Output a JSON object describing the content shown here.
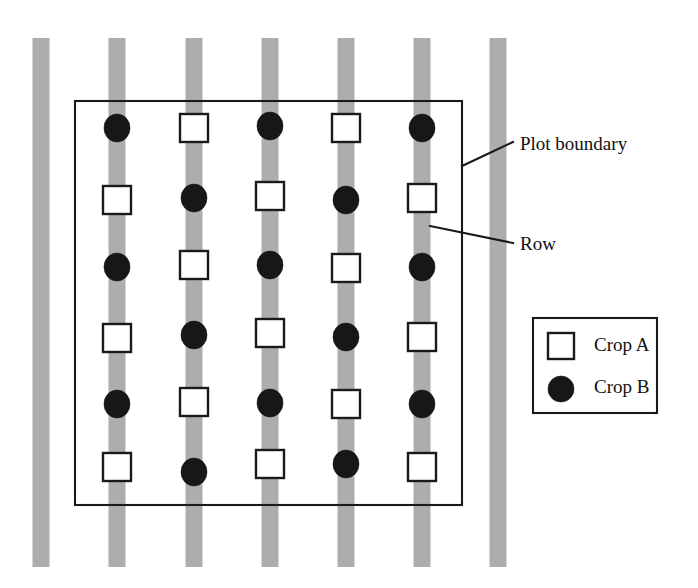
{
  "figure": {
    "width": 698,
    "height": 588,
    "background_color": "#ffffff"
  },
  "colors": {
    "row_stripe": "#adadad",
    "line": "#1a1a1a",
    "crop_a_fill": "#ffffff",
    "crop_b_fill": "#171717",
    "text": "#111111",
    "background": "#ffffff"
  },
  "annotations": [
    {
      "id": "plot-boundary",
      "label": "Plot boundary",
      "text_x": 520,
      "text_y": 146,
      "leader": {
        "x1": 462,
        "y1": 166,
        "x2": 513,
        "y2": 142
      }
    },
    {
      "id": "row",
      "label": "Row",
      "text_x": 520,
      "text_y": 246,
      "leader": {
        "x1": 430,
        "y1": 226,
        "x2": 513,
        "y2": 243
      }
    }
  ],
  "legend": {
    "box": {
      "x": 533,
      "y": 318,
      "width": 124,
      "height": 95
    },
    "entries": [
      {
        "id": "legend-crop-a",
        "label": "Crop A",
        "marker": "open-square",
        "marker_x": 548,
        "marker_y": 333,
        "marker_size": 26,
        "text_x": 594,
        "text_y": 347
      },
      {
        "id": "legend-crop-b",
        "label": "Crop B",
        "marker": "filled-circle",
        "marker_cx": 561,
        "marker_cy": 389,
        "marker_rx": 13,
        "marker_ry": 13,
        "text_x": 594,
        "text_y": 389
      }
    ]
  },
  "plot_boundary": {
    "x": 75,
    "y": 101,
    "width": 387,
    "height": 404
  },
  "chart_data": {
    "type": "diagram",
    "legend_position": "right-middle",
    "row_stripe": {
      "count": 7,
      "width": 17,
      "y_top": 38,
      "y_bottom": 567,
      "centers_x": [
        41,
        117,
        194,
        270,
        346,
        422,
        498
      ],
      "inside_plot_indices": [
        1,
        2,
        3,
        4,
        5
      ]
    },
    "plants": [
      {
        "row_index": 1,
        "center_x": 117,
        "markers": [
          {
            "type": "crop-b",
            "y": 128
          },
          {
            "type": "crop-a",
            "y": 200
          },
          {
            "type": "crop-b",
            "y": 267
          },
          {
            "type": "crop-a",
            "y": 338
          },
          {
            "type": "crop-b",
            "y": 404
          },
          {
            "type": "crop-a",
            "y": 467
          }
        ]
      },
      {
        "row_index": 2,
        "center_x": 194,
        "markers": [
          {
            "type": "crop-a",
            "y": 128
          },
          {
            "type": "crop-b",
            "y": 198
          },
          {
            "type": "crop-a",
            "y": 265
          },
          {
            "type": "crop-b",
            "y": 335
          },
          {
            "type": "crop-a",
            "y": 402
          },
          {
            "type": "crop-b",
            "y": 472
          }
        ]
      },
      {
        "row_index": 3,
        "center_x": 270,
        "markers": [
          {
            "type": "crop-b",
            "y": 126
          },
          {
            "type": "crop-a",
            "y": 196
          },
          {
            "type": "crop-b",
            "y": 265
          },
          {
            "type": "crop-a",
            "y": 333
          },
          {
            "type": "crop-b",
            "y": 403
          },
          {
            "type": "crop-a",
            "y": 464
          }
        ]
      },
      {
        "row_index": 4,
        "center_x": 346,
        "markers": [
          {
            "type": "crop-a",
            "y": 128
          },
          {
            "type": "crop-b",
            "y": 200
          },
          {
            "type": "crop-a",
            "y": 268
          },
          {
            "type": "crop-b",
            "y": 337
          },
          {
            "type": "crop-a",
            "y": 404
          },
          {
            "type": "crop-b",
            "y": 464
          }
        ]
      },
      {
        "row_index": 5,
        "center_x": 422,
        "markers": [
          {
            "type": "crop-b",
            "y": 128
          },
          {
            "type": "crop-a",
            "y": 198
          },
          {
            "type": "crop-b",
            "y": 267
          },
          {
            "type": "crop-a",
            "y": 337
          },
          {
            "type": "crop-b",
            "y": 404
          },
          {
            "type": "crop-a",
            "y": 467
          }
        ]
      }
    ],
    "marker_styles": {
      "crop-a": {
        "shape": "square",
        "size": 28,
        "fill": "#ffffff",
        "stroke": "#1a1a1a"
      },
      "crop-b": {
        "shape": "circle",
        "rx": 13,
        "ry": 14,
        "fill": "#171717"
      }
    }
  }
}
